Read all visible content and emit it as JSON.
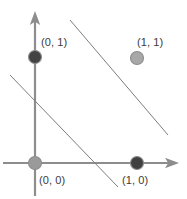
{
  "figure": {
    "width": 187,
    "height": 199,
    "background": "#ffffff"
  },
  "chart_data": {
    "type": "scatter",
    "title": "",
    "xlabel": "",
    "ylabel": "",
    "xlim": [
      -0.35,
      1.45
    ],
    "ylim": [
      -0.35,
      1.55
    ],
    "grid": false,
    "legend": null,
    "axes": {
      "x_axis": {
        "color": "#8d8d8d",
        "arrow": "right",
        "from_px": [
          3,
          163
        ],
        "to_px": [
          178,
          163
        ]
      },
      "y_axis": {
        "color": "#8d8d8d",
        "arrow": "up",
        "from_px": [
          35,
          196
        ],
        "to_px": [
          35,
          12
        ]
      }
    },
    "points": [
      {
        "label": "(0, 1)",
        "x": 0,
        "y": 1,
        "px": [
          35,
          57
        ],
        "radius": 6.5,
        "fill": "#434343",
        "stroke": "#8d8d8d",
        "label_px": [
          41,
          36
        ]
      },
      {
        "label": "(1, 1)",
        "x": 1,
        "y": 1,
        "px": [
          137,
          58
        ],
        "radius": 6.5,
        "fill": "#a8a8a8",
        "stroke": "#8d8d8d",
        "label_px": [
          137,
          36
        ]
      },
      {
        "label": "(0, 0)",
        "x": 0,
        "y": 0,
        "px": [
          35,
          163
        ],
        "radius": 6.5,
        "fill": "#9a9a9a",
        "stroke": "#8d8d8d",
        "label_px": [
          39,
          174
        ]
      },
      {
        "label": "(1, 0)",
        "x": 1,
        "y": 0,
        "px": [
          137,
          163
        ],
        "radius": 6.5,
        "fill": "#404040",
        "stroke": "#8d8d8d",
        "label_px": [
          122,
          174
        ]
      }
    ],
    "lines": [
      {
        "name": "upper-separator-line",
        "color": "#7d7d7d",
        "width": 1,
        "from_px": [
          70,
          20
        ],
        "to_px": [
          168,
          135
        ]
      },
      {
        "name": "lower-separator-line",
        "color": "#7d7d7d",
        "width": 1,
        "from_px": [
          10,
          75
        ],
        "to_px": [
          118,
          187
        ]
      }
    ]
  }
}
